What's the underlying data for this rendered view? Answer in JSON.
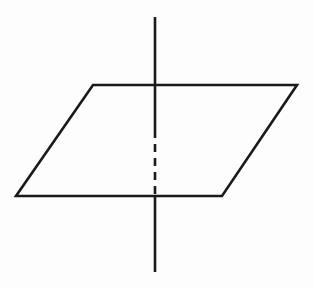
{
  "figure": {
    "title": "Plane intersected by a perpendicular line",
    "canvas": {
      "width": 313,
      "height": 289
    },
    "colors": {
      "background": "#fdfdfd",
      "ink": "#1a1a1a",
      "plane_fill": "none"
    },
    "stroke": {
      "solid_width": 2.6,
      "dashed_width": 2.6,
      "dash_pattern": "8 6"
    },
    "elements": {
      "plane": {
        "label": "plane",
        "shape": "parallelogram",
        "points": "93,85 297,85 222,196 16,196",
        "vertices": [
          {
            "name": "top-left",
            "x": 93,
            "y": 85
          },
          {
            "name": "top-right",
            "x": 297,
            "y": 85
          },
          {
            "name": "bottom-right",
            "x": 222,
            "y": 196
          },
          {
            "name": "bottom-left",
            "x": 16,
            "y": 196
          }
        ]
      },
      "line_above": {
        "label": "line segment above plane",
        "x1": 155,
        "y1": 17,
        "x2": 155,
        "y2": 85
      },
      "line_hidden": {
        "label": "hidden line segment behind plane",
        "x1": 155,
        "y1": 130,
        "x2": 155,
        "y2": 196,
        "style": "dashed"
      },
      "line_below": {
        "label": "line segment below plane",
        "x1": 155,
        "y1": 196,
        "x2": 155,
        "y2": 272
      },
      "line_through_front": {
        "label": "line segment in front of plane near top edge",
        "x1": 155,
        "y1": 85,
        "x2": 155,
        "y2": 130
      }
    }
  }
}
